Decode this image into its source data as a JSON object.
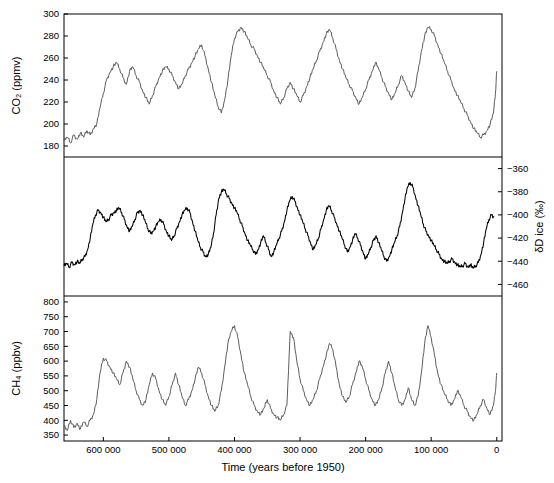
{
  "figure": {
    "xlabel": "Time (years before 1950)",
    "xticks": [
      600000,
      500000,
      400000,
      300000,
      200000,
      100000,
      0
    ],
    "xticklabels": [
      "600 000",
      "500 000",
      "400 000",
      "300 000",
      "200 000",
      "100 000",
      "0"
    ],
    "xlim": [
      660000,
      -8000
    ]
  },
  "chart_data": [
    {
      "type": "line",
      "name": "co2",
      "title": "",
      "xlabel": "Time (years before 1950)",
      "ylabel": "CO₂ (ppmv)",
      "ylim": [
        170,
        300
      ],
      "yticks": [
        180,
        200,
        220,
        240,
        260,
        280,
        300
      ],
      "yticklabels": [
        "180",
        "200",
        "220",
        "240",
        "260",
        "280",
        "300"
      ],
      "color": "#555555",
      "grid": false,
      "x": [
        660000,
        655000,
        650000,
        645000,
        640000,
        635000,
        630000,
        625000,
        620000,
        615000,
        610000,
        605000,
        600000,
        595000,
        590000,
        585000,
        580000,
        575000,
        570000,
        565000,
        560000,
        555000,
        550000,
        545000,
        540000,
        535000,
        530000,
        525000,
        520000,
        515000,
        510000,
        505000,
        500000,
        495000,
        490000,
        485000,
        480000,
        475000,
        470000,
        465000,
        460000,
        455000,
        450000,
        445000,
        440000,
        435000,
        430000,
        425000,
        420000,
        415000,
        410000,
        405000,
        400000,
        395000,
        390000,
        385000,
        380000,
        375000,
        370000,
        365000,
        360000,
        355000,
        350000,
        345000,
        340000,
        335000,
        330000,
        325000,
        320000,
        315000,
        310000,
        305000,
        300000,
        295000,
        290000,
        285000,
        280000,
        275000,
        270000,
        265000,
        260000,
        255000,
        250000,
        245000,
        240000,
        235000,
        230000,
        225000,
        220000,
        215000,
        210000,
        205000,
        200000,
        195000,
        190000,
        185000,
        180000,
        175000,
        170000,
        165000,
        160000,
        155000,
        150000,
        145000,
        140000,
        135000,
        130000,
        125000,
        120000,
        115000,
        110000,
        105000,
        100000,
        95000,
        90000,
        85000,
        80000,
        75000,
        70000,
        65000,
        60000,
        55000,
        50000,
        45000,
        40000,
        35000,
        30000,
        25000,
        20000,
        15000,
        10000,
        5000,
        2000,
        0
      ],
      "y": [
        185,
        188,
        183,
        190,
        186,
        192,
        188,
        194,
        190,
        196,
        200,
        215,
        228,
        240,
        247,
        252,
        256,
        250,
        242,
        236,
        248,
        252,
        244,
        238,
        230,
        224,
        218,
        226,
        234,
        242,
        248,
        252,
        250,
        244,
        238,
        232,
        236,
        244,
        250,
        256,
        262,
        268,
        272,
        262,
        250,
        238,
        226,
        216,
        210,
        222,
        240,
        262,
        278,
        284,
        288,
        284,
        278,
        272,
        268,
        262,
        256,
        250,
        244,
        238,
        230,
        224,
        218,
        224,
        232,
        238,
        232,
        226,
        220,
        226,
        234,
        242,
        250,
        258,
        266,
        274,
        282,
        286,
        278,
        268,
        258,
        250,
        242,
        236,
        230,
        224,
        218,
        224,
        232,
        240,
        248,
        256,
        250,
        242,
        234,
        228,
        222,
        228,
        236,
        244,
        238,
        230,
        224,
        232,
        248,
        266,
        280,
        288,
        286,
        280,
        272,
        264,
        256,
        248,
        240,
        232,
        226,
        220,
        214,
        208,
        202,
        196,
        192,
        188,
        190,
        194,
        200,
        210,
        228,
        248,
        268,
        284,
        292,
        286
      ]
    },
    {
      "type": "line",
      "name": "dD_ice",
      "title": "",
      "xlabel": "",
      "ylabel": "δD ice (‰)",
      "ylim": [
        -470,
        -350
      ],
      "yticks": [
        -360,
        -380,
        -400,
        -420,
        -440,
        -460
      ],
      "yticklabels": [
        "−360",
        "−380",
        "−400",
        "−420",
        "−440",
        "−460"
      ],
      "color": "#000000",
      "grid": false,
      "x": [
        660000,
        656000,
        652000,
        648000,
        644000,
        640000,
        636000,
        632000,
        628000,
        624000,
        620000,
        616000,
        612000,
        608000,
        604000,
        600000,
        596000,
        592000,
        588000,
        584000,
        580000,
        576000,
        572000,
        568000,
        564000,
        560000,
        556000,
        552000,
        548000,
        544000,
        540000,
        536000,
        532000,
        528000,
        524000,
        520000,
        516000,
        512000,
        508000,
        504000,
        500000,
        496000,
        492000,
        488000,
        484000,
        480000,
        476000,
        472000,
        468000,
        464000,
        460000,
        456000,
        452000,
        448000,
        444000,
        440000,
        436000,
        432000,
        428000,
        424000,
        420000,
        416000,
        412000,
        408000,
        404000,
        400000,
        396000,
        392000,
        388000,
        384000,
        380000,
        376000,
        372000,
        368000,
        364000,
        360000,
        356000,
        352000,
        348000,
        344000,
        340000,
        336000,
        332000,
        328000,
        324000,
        320000,
        316000,
        312000,
        308000,
        304000,
        300000,
        296000,
        292000,
        288000,
        284000,
        280000,
        276000,
        272000,
        268000,
        264000,
        260000,
        256000,
        252000,
        248000,
        244000,
        240000,
        236000,
        232000,
        228000,
        224000,
        220000,
        216000,
        212000,
        208000,
        204000,
        200000,
        196000,
        192000,
        188000,
        184000,
        180000,
        176000,
        172000,
        168000,
        164000,
        160000,
        156000,
        152000,
        148000,
        144000,
        140000,
        136000,
        132000,
        128000,
        124000,
        120000,
        116000,
        112000,
        108000,
        104000,
        100000,
        96000,
        92000,
        88000,
        84000,
        80000,
        76000,
        72000,
        68000,
        64000,
        60000,
        56000,
        52000,
        48000,
        44000,
        40000,
        36000,
        32000,
        28000,
        24000,
        20000,
        16000,
        12000,
        8000,
        4000,
        0
      ],
      "y": [
        -444,
        -442,
        -445,
        -441,
        -443,
        -440,
        -442,
        -438,
        -436,
        -430,
        -420,
        -408,
        -400,
        -396,
        -398,
        -402,
        -406,
        -404,
        -400,
        -398,
        -396,
        -394,
        -398,
        -404,
        -410,
        -414,
        -410,
        -404,
        -398,
        -396,
        -400,
        -406,
        -412,
        -416,
        -414,
        -410,
        -406,
        -404,
        -408,
        -414,
        -418,
        -422,
        -418,
        -412,
        -406,
        -400,
        -396,
        -394,
        -398,
        -406,
        -414,
        -422,
        -428,
        -432,
        -436,
        -434,
        -428,
        -416,
        -400,
        -386,
        -380,
        -378,
        -382,
        -386,
        -390,
        -394,
        -398,
        -404,
        -410,
        -416,
        -422,
        -426,
        -430,
        -434,
        -430,
        -424,
        -418,
        -424,
        -430,
        -436,
        -432,
        -426,
        -420,
        -414,
        -406,
        -396,
        -388,
        -384,
        -388,
        -394,
        -400,
        -406,
        -412,
        -418,
        -424,
        -430,
        -426,
        -420,
        -412,
        -404,
        -396,
        -392,
        -396,
        -402,
        -408,
        -414,
        -420,
        -426,
        -432,
        -428,
        -422,
        -416,
        -420,
        -426,
        -432,
        -438,
        -434,
        -428,
        -422,
        -418,
        -424,
        -430,
        -436,
        -440,
        -436,
        -430,
        -424,
        -418,
        -410,
        -398,
        -386,
        -376,
        -372,
        -376,
        -384,
        -392,
        -400,
        -408,
        -414,
        -418,
        -422,
        -426,
        -430,
        -434,
        -438,
        -440,
        -442,
        -440,
        -438,
        -441,
        -443,
        -445,
        -444,
        -442,
        -445,
        -443,
        -446,
        -444,
        -441,
        -434,
        -424,
        -412,
        -404,
        -400,
        -402
      ]
    },
    {
      "type": "line",
      "name": "ch4",
      "title": "",
      "xlabel": "",
      "ylabel": "CH₄ (ppbv)",
      "ylim": [
        330,
        820
      ],
      "yticks": [
        350,
        400,
        450,
        500,
        550,
        600,
        650,
        700,
        750,
        800
      ],
      "yticklabels": [
        "350",
        "400",
        "450",
        "500",
        "550",
        "600",
        "650",
        "700",
        "750",
        "800"
      ],
      "color": "#555555",
      "grid": false,
      "x": [
        660000,
        655000,
        650000,
        645000,
        640000,
        635000,
        630000,
        625000,
        620000,
        615000,
        610000,
        605000,
        600000,
        595000,
        590000,
        585000,
        580000,
        575000,
        570000,
        565000,
        560000,
        555000,
        550000,
        545000,
        540000,
        535000,
        530000,
        525000,
        520000,
        515000,
        510000,
        505000,
        500000,
        495000,
        490000,
        485000,
        480000,
        475000,
        470000,
        465000,
        460000,
        455000,
        450000,
        445000,
        440000,
        435000,
        430000,
        425000,
        420000,
        415000,
        410000,
        405000,
        400000,
        395000,
        390000,
        385000,
        380000,
        375000,
        370000,
        365000,
        360000,
        355000,
        350000,
        345000,
        340000,
        335000,
        330000,
        325000,
        320000,
        315000,
        310000,
        305000,
        300000,
        295000,
        290000,
        285000,
        280000,
        275000,
        270000,
        265000,
        260000,
        255000,
        250000,
        245000,
        240000,
        235000,
        230000,
        225000,
        220000,
        215000,
        210000,
        205000,
        200000,
        195000,
        190000,
        185000,
        180000,
        175000,
        170000,
        165000,
        160000,
        155000,
        150000,
        145000,
        140000,
        135000,
        130000,
        125000,
        120000,
        115000,
        110000,
        105000,
        100000,
        95000,
        90000,
        85000,
        80000,
        75000,
        70000,
        65000,
        60000,
        55000,
        50000,
        45000,
        40000,
        35000,
        30000,
        25000,
        20000,
        15000,
        10000,
        5000,
        2000,
        0
      ],
      "y": [
        380,
        365,
        400,
        375,
        390,
        370,
        395,
        380,
        400,
        420,
        470,
        560,
        610,
        600,
        580,
        560,
        540,
        520,
        560,
        600,
        580,
        540,
        500,
        470,
        450,
        470,
        520,
        560,
        540,
        500,
        470,
        450,
        480,
        520,
        560,
        520,
        480,
        450,
        470,
        500,
        540,
        580,
        560,
        520,
        480,
        450,
        430,
        450,
        500,
        580,
        660,
        700,
        720,
        680,
        620,
        560,
        520,
        480,
        450,
        430,
        420,
        440,
        470,
        440,
        420,
        410,
        400,
        420,
        450,
        700,
        680,
        600,
        540,
        500,
        470,
        450,
        470,
        500,
        540,
        580,
        620,
        660,
        640,
        580,
        520,
        480,
        460,
        480,
        520,
        560,
        600,
        580,
        540,
        500,
        470,
        450,
        470,
        510,
        560,
        600,
        560,
        510,
        470,
        450,
        470,
        510,
        470,
        450,
        480,
        560,
        660,
        720,
        680,
        620,
        560,
        520,
        490,
        470,
        450,
        470,
        500,
        480,
        450,
        430,
        410,
        400,
        420,
        450,
        470,
        440,
        420,
        450,
        500,
        560,
        620,
        680,
        700,
        690
      ]
    }
  ]
}
